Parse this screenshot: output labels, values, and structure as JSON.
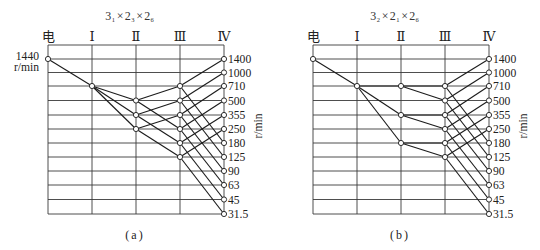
{
  "diagrams": [
    {
      "id": "a",
      "title_text": "3₁×2₃×2₆",
      "title_parts": [
        {
          "base": "3",
          "sub": "1"
        },
        {
          "base": "2",
          "sub": "3"
        },
        {
          "base": "2",
          "sub": "6"
        }
      ],
      "title_separator": "×",
      "shaft_labels": [
        "电",
        "Ⅰ",
        "Ⅱ",
        "Ⅲ",
        "Ⅳ"
      ],
      "speed_labels": [
        "1400",
        "1000",
        "710",
        "500",
        "355",
        "250",
        "180",
        "125",
        "90",
        "63",
        "45",
        "31.5"
      ],
      "unit_label": "r/min",
      "motor_label": {
        "speed": "1440",
        "unit": "r/min"
      },
      "caption": "(a)",
      "transmissions": [
        [
          0,
          0,
          1,
          2
        ],
        [
          1,
          2,
          2,
          3
        ],
        [
          1,
          2,
          2,
          4
        ],
        [
          1,
          2,
          2,
          5
        ],
        [
          2,
          3,
          3,
          2
        ],
        [
          2,
          3,
          3,
          5
        ],
        [
          2,
          4,
          3,
          3
        ],
        [
          2,
          4,
          3,
          6
        ],
        [
          2,
          5,
          3,
          4
        ],
        [
          2,
          5,
          3,
          7
        ],
        [
          3,
          2,
          4,
          0
        ],
        [
          3,
          2,
          4,
          6
        ],
        [
          3,
          3,
          4,
          1
        ],
        [
          3,
          3,
          4,
          7
        ],
        [
          3,
          4,
          4,
          2
        ],
        [
          3,
          4,
          4,
          8
        ],
        [
          3,
          5,
          4,
          3
        ],
        [
          3,
          5,
          4,
          9
        ],
        [
          3,
          6,
          4,
          4
        ],
        [
          3,
          6,
          4,
          10
        ],
        [
          3,
          7,
          4,
          5
        ],
        [
          3,
          7,
          4,
          11
        ]
      ]
    },
    {
      "id": "b",
      "title_text": "3₂×2₁×2₆",
      "title_parts": [
        {
          "base": "3",
          "sub": "2"
        },
        {
          "base": "2",
          "sub": "1"
        },
        {
          "base": "2",
          "sub": "6"
        }
      ],
      "title_separator": "×",
      "shaft_labels": [
        "电",
        "Ⅰ",
        "Ⅱ",
        "Ⅲ",
        "Ⅳ"
      ],
      "speed_labels": [
        "1400",
        "1000",
        "710",
        "500",
        "355",
        "250",
        "180",
        "125",
        "90",
        "63",
        "45",
        "31.5"
      ],
      "unit_label": "r/min",
      "caption": "(b)",
      "transmissions": [
        [
          0,
          0,
          1,
          2
        ],
        [
          1,
          2,
          2,
          2
        ],
        [
          1,
          2,
          2,
          4
        ],
        [
          1,
          2,
          2,
          6
        ],
        [
          2,
          2,
          3,
          2
        ],
        [
          2,
          2,
          3,
          3
        ],
        [
          2,
          4,
          3,
          4
        ],
        [
          2,
          4,
          3,
          5
        ],
        [
          2,
          6,
          3,
          6
        ],
        [
          2,
          6,
          3,
          7
        ],
        [
          3,
          2,
          4,
          0
        ],
        [
          3,
          2,
          4,
          6
        ],
        [
          3,
          3,
          4,
          1
        ],
        [
          3,
          3,
          4,
          7
        ],
        [
          3,
          4,
          4,
          2
        ],
        [
          3,
          4,
          4,
          8
        ],
        [
          3,
          5,
          4,
          3
        ],
        [
          3,
          5,
          4,
          9
        ],
        [
          3,
          6,
          4,
          4
        ],
        [
          3,
          6,
          4,
          10
        ],
        [
          3,
          7,
          4,
          5
        ],
        [
          3,
          7,
          4,
          11
        ]
      ]
    }
  ]
}
